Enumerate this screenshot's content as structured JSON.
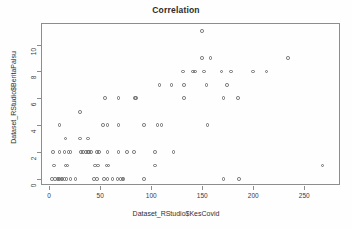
{
  "chart_data": {
    "type": "scatter",
    "title": "Correlation",
    "xlabel": "Dataset_RStudio$KesCovid",
    "ylabel": "Dataset_RStudio$BeritaPalsu",
    "xlim": [
      -8,
      285
    ],
    "ylim": [
      -0.45,
      11.6
    ],
    "xticks": [
      0,
      50,
      100,
      150,
      200,
      250
    ],
    "yticks": [
      0,
      2,
      4,
      6,
      8,
      10
    ],
    "grid": false,
    "legend": null,
    "marker": "open-circle",
    "marker_color": "#6e6e6e",
    "points": [
      [
        3,
        0
      ],
      [
        6,
        0
      ],
      [
        8,
        0
      ],
      [
        9,
        0
      ],
      [
        10,
        0
      ],
      [
        12,
        0
      ],
      [
        13,
        0
      ],
      [
        15,
        0
      ],
      [
        17,
        0
      ],
      [
        21,
        0
      ],
      [
        26,
        0
      ],
      [
        44,
        0
      ],
      [
        47,
        0
      ],
      [
        54,
        0
      ],
      [
        57,
        0
      ],
      [
        62,
        0
      ],
      [
        67,
        0
      ],
      [
        70,
        0
      ],
      [
        72,
        0
      ],
      [
        73,
        0
      ],
      [
        93,
        0
      ],
      [
        171,
        0
      ],
      [
        186,
        0
      ],
      [
        5,
        1
      ],
      [
        16,
        1
      ],
      [
        18,
        1
      ],
      [
        45,
        1
      ],
      [
        48,
        1
      ],
      [
        56,
        1
      ],
      [
        58,
        1
      ],
      [
        104,
        1
      ],
      [
        268,
        1
      ],
      [
        4,
        2
      ],
      [
        10,
        2
      ],
      [
        15,
        2
      ],
      [
        19,
        2
      ],
      [
        21,
        2
      ],
      [
        31,
        2
      ],
      [
        33,
        2
      ],
      [
        36,
        2
      ],
      [
        38,
        2
      ],
      [
        39,
        2
      ],
      [
        41,
        2
      ],
      [
        47,
        2
      ],
      [
        49,
        2
      ],
      [
        57,
        2
      ],
      [
        68,
        2
      ],
      [
        76,
        2
      ],
      [
        83,
        2
      ],
      [
        104,
        2
      ],
      [
        122,
        2
      ],
      [
        16,
        3
      ],
      [
        30,
        3
      ],
      [
        38,
        3
      ],
      [
        10,
        4
      ],
      [
        53,
        4
      ],
      [
        57,
        4
      ],
      [
        68,
        4
      ],
      [
        93,
        4
      ],
      [
        106,
        4
      ],
      [
        110,
        4
      ],
      [
        155,
        4
      ],
      [
        30,
        5
      ],
      [
        55,
        6
      ],
      [
        68,
        6
      ],
      [
        84,
        6
      ],
      [
        85,
        6
      ],
      [
        132,
        6
      ],
      [
        171,
        6
      ],
      [
        185,
        6
      ],
      [
        108,
        7
      ],
      [
        120,
        7
      ],
      [
        132,
        7
      ],
      [
        154,
        7
      ],
      [
        174,
        7
      ],
      [
        131,
        8
      ],
      [
        141,
        8
      ],
      [
        143,
        8
      ],
      [
        152,
        8
      ],
      [
        169,
        8
      ],
      [
        178,
        8
      ],
      [
        200,
        8
      ],
      [
        213,
        8
      ],
      [
        150,
        9
      ],
      [
        158,
        9
      ],
      [
        234,
        9
      ],
      [
        150,
        11
      ]
    ],
    "n_points": 88
  }
}
